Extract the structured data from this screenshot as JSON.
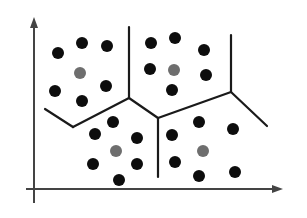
{
  "diagram": {
    "type": "voronoi-clustering",
    "colors": {
      "background": "#ffffff",
      "axis": "#444444",
      "boundary": "#1a1a1a",
      "point": "#0d0d0d",
      "centroid": "#6e6e6e"
    },
    "axes": {
      "y_axis": {
        "x": 34,
        "y_top": 17,
        "y_bottom": 203
      },
      "x_axis": {
        "y": 189,
        "x_left": 26,
        "x_right": 283
      }
    },
    "boundaries": [
      {
        "from": [
          129,
          27
        ],
        "to": [
          129,
          98
        ]
      },
      {
        "from": [
          45,
          109
        ],
        "to": [
          73,
          127
        ]
      },
      {
        "from": [
          73,
          127
        ],
        "to": [
          129,
          98
        ]
      },
      {
        "from": [
          129,
          98
        ],
        "to": [
          158,
          118
        ]
      },
      {
        "from": [
          158,
          118
        ],
        "to": [
          158,
          177
        ]
      },
      {
        "from": [
          158,
          118
        ],
        "to": [
          231,
          92
        ]
      },
      {
        "from": [
          231,
          92
        ],
        "to": [
          231,
          35
        ]
      },
      {
        "from": [
          231,
          92
        ],
        "to": [
          267,
          126
        ]
      }
    ],
    "clusters": [
      {
        "name": "top-left",
        "centroid": [
          80,
          73
        ],
        "points": [
          [
            58,
            53
          ],
          [
            82,
            43
          ],
          [
            107,
            46
          ],
          [
            55,
            91
          ],
          [
            82,
            101
          ],
          [
            106,
            86
          ]
        ]
      },
      {
        "name": "top-right",
        "centroid": [
          174,
          70
        ],
        "points": [
          [
            151,
            43
          ],
          [
            175,
            38
          ],
          [
            204,
            50
          ],
          [
            150,
            69
          ],
          [
            206,
            75
          ],
          [
            172,
            90
          ]
        ]
      },
      {
        "name": "bottom-left",
        "centroid": [
          116,
          151
        ],
        "points": [
          [
            113,
            122
          ],
          [
            95,
            134
          ],
          [
            137,
            138
          ],
          [
            93,
            164
          ],
          [
            137,
            164
          ],
          [
            119,
            180
          ]
        ]
      },
      {
        "name": "bottom-right",
        "centroid": [
          203,
          151
        ],
        "points": [
          [
            172,
            135
          ],
          [
            199,
            122
          ],
          [
            233,
            129
          ],
          [
            175,
            162
          ],
          [
            199,
            176
          ],
          [
            235,
            172
          ]
        ]
      }
    ],
    "point_radius": 6,
    "centroid_radius": 6
  }
}
